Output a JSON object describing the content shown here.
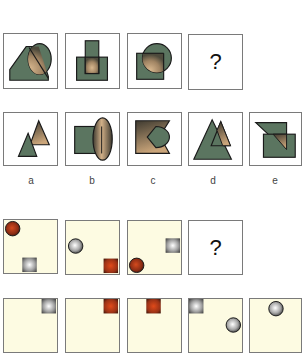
{
  "puzzle1": {
    "question_row": [
      {
        "id": "q1",
        "shapes": [
          "pentagon-house",
          "ellipse"
        ]
      },
      {
        "id": "q2",
        "shapes": [
          "rectangle-vertical",
          "rectangle-horizontal"
        ]
      },
      {
        "id": "q3",
        "shapes": [
          "square",
          "circle"
        ]
      },
      {
        "id": "q4",
        "text": "?"
      }
    ],
    "answer_row": [
      {
        "id": "a",
        "label": "a",
        "shapes": [
          "triangle",
          "triangle"
        ]
      },
      {
        "id": "b",
        "label": "b",
        "shapes": [
          "rectangle",
          "ellipse-vertical"
        ]
      },
      {
        "id": "c",
        "label": "c",
        "shapes": [
          "notched-rectangle",
          "pacman-circle"
        ]
      },
      {
        "id": "d",
        "label": "d",
        "shapes": [
          "large-triangle",
          "small-triangle"
        ]
      },
      {
        "id": "e",
        "label": "e",
        "shapes": [
          "right-triangle",
          "rectangle"
        ]
      }
    ]
  },
  "puzzle2": {
    "question_row": [
      {
        "id": "q1",
        "circle": "red",
        "square": "silver"
      },
      {
        "id": "q2",
        "circle": "silver",
        "square": "red"
      },
      {
        "id": "q3",
        "circle": "red",
        "square": "silver"
      },
      {
        "id": "q4",
        "text": "?"
      }
    ],
    "answer_row": [
      {
        "id": "a2",
        "square": "silver"
      },
      {
        "id": "b2",
        "square": "red"
      },
      {
        "id": "c2",
        "square": "red"
      },
      {
        "id": "d2",
        "square": "silver",
        "circle": "silver"
      },
      {
        "id": "e2",
        "circle": "silver"
      }
    ]
  },
  "colors": {
    "shape_green": "#5b7560",
    "shape_outline": "#1a1a1a",
    "overlap_tan": "#b89a78",
    "cream_bg": "#fdfbe2",
    "ball_red": "#a8361a",
    "ball_silver": "#bdbdbd",
    "box_border": "#7a7a7a"
  }
}
